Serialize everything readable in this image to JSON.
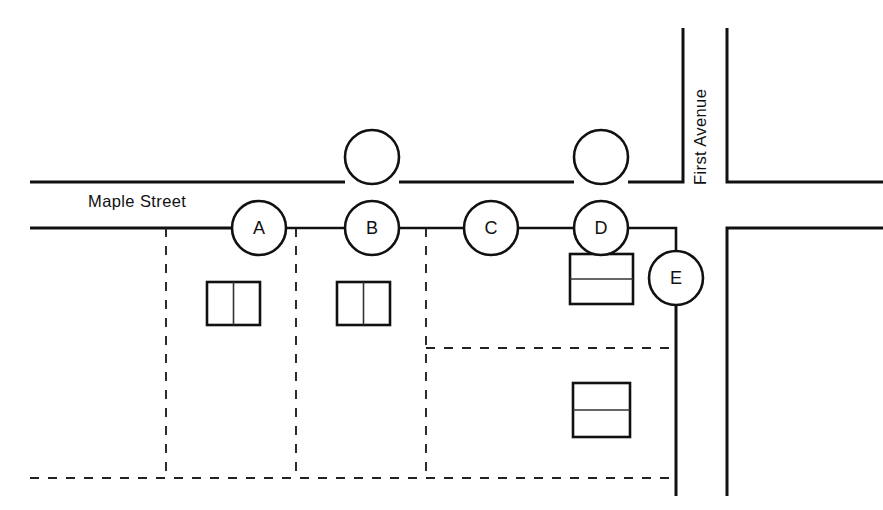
{
  "figure": {
    "width": 883,
    "height": 510,
    "background_color": "#ffffff",
    "line_color": "#111111"
  },
  "streets": [
    {
      "id": "maple-street",
      "label": "Maple Street",
      "orientation": "horizontal",
      "label_x": 88,
      "label_y": 207,
      "rotation": 0
    },
    {
      "id": "first-avenue",
      "label": "First Avenue",
      "orientation": "vertical",
      "label_x": 706,
      "label_y": 185,
      "rotation": -90
    }
  ],
  "nodes": [
    {
      "id": "node-top-left",
      "label": "",
      "cx": 372,
      "cy": 157,
      "r": 27
    },
    {
      "id": "node-top-right",
      "label": "",
      "cx": 601,
      "cy": 157,
      "r": 27
    },
    {
      "id": "node-a",
      "label": "A",
      "cx": 259,
      "cy": 228,
      "r": 27
    },
    {
      "id": "node-b",
      "label": "B",
      "cx": 372,
      "cy": 228,
      "r": 27
    },
    {
      "id": "node-c",
      "label": "C",
      "cx": 491,
      "cy": 228,
      "r": 27
    },
    {
      "id": "node-d",
      "label": "D",
      "cx": 601,
      "cy": 228,
      "r": 27
    },
    {
      "id": "node-e",
      "label": "E",
      "cx": 676,
      "cy": 278,
      "r": 27
    }
  ],
  "buildings": [
    {
      "id": "building-a",
      "x": 207,
      "y": 282,
      "w": 53,
      "h": 43,
      "split": "vertical"
    },
    {
      "id": "building-b",
      "x": 337,
      "y": 282,
      "w": 53,
      "h": 43,
      "split": "vertical"
    },
    {
      "id": "building-d",
      "x": 570,
      "y": 254,
      "w": 63,
      "h": 50,
      "split": "horizontal"
    },
    {
      "id": "building-lower-right",
      "x": 573,
      "y": 383,
      "w": 57,
      "h": 54,
      "split": "horizontal"
    }
  ],
  "road_segments": [
    {
      "id": "maple-upper-left",
      "d": "M 30 182 L 345 182"
    },
    {
      "id": "maple-upper-middle",
      "d": "M 399 182 L 574 182"
    },
    {
      "id": "maple-upper-right",
      "d": "M 628 182 L 683 182 L 683 28"
    },
    {
      "id": "maple-lower-left",
      "d": "M 30 228 L 232 228"
    },
    {
      "id": "first-ave-upper-right-corner",
      "d": "M 727 28 L 727 182 L 883 182"
    },
    {
      "id": "first-ave-lower-right-corner",
      "d": "M 883 228 L 727 228 L 727 496"
    },
    {
      "id": "first-ave-left-lower",
      "d": "M 676 251 L 676 496"
    }
  ],
  "connector_segments": [
    {
      "id": "connector-a-b",
      "d": "M 286 228 L 345 228"
    },
    {
      "id": "connector-b-c",
      "d": "M 399 228 L 464 228"
    },
    {
      "id": "connector-c-d",
      "d": "M 518 228 L 574 228"
    },
    {
      "id": "connector-d-e",
      "d": "M 628 228 L 676 228 L 676 251"
    }
  ],
  "parcel_lines": [
    {
      "id": "parcel-vertical-1",
      "d": "M 166 228 L 166 478"
    },
    {
      "id": "parcel-vertical-2",
      "d": "M 296 228 L 296 478"
    },
    {
      "id": "parcel-vertical-3",
      "d": "M 426 228 L 426 478"
    },
    {
      "id": "parcel-horizontal-mid",
      "d": "M 426 348 L 676 348"
    },
    {
      "id": "parcel-horizontal-bottom",
      "d": "M 30 478 L 676 478"
    }
  ]
}
